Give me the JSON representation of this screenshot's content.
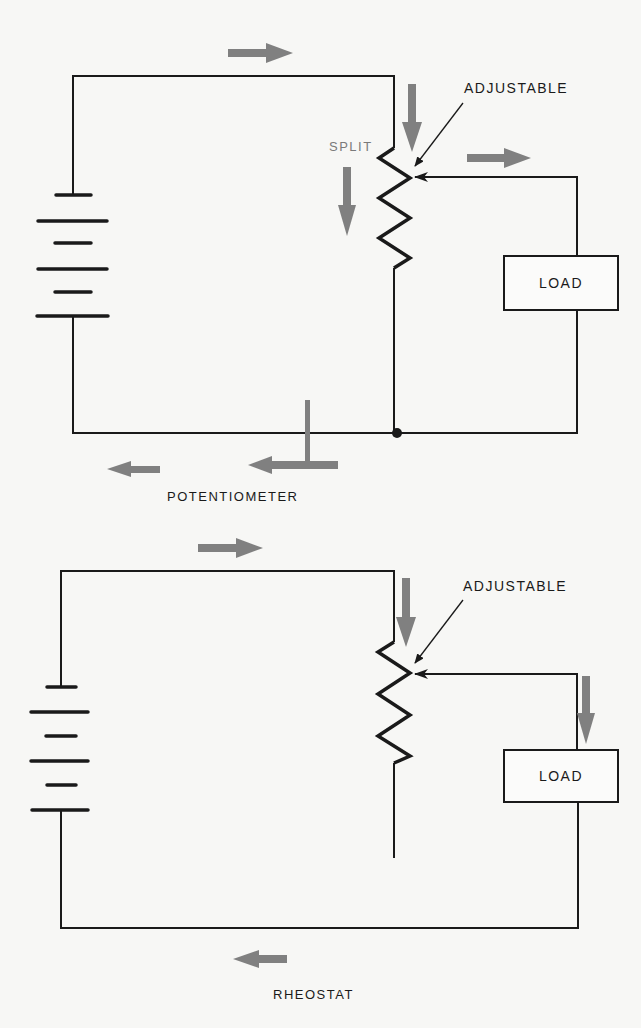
{
  "diagrams": [
    {
      "name": "potentiometer",
      "caption": "POTENTIOMETER",
      "labels": {
        "adjustable": "ADJUSTABLE",
        "split": "SPLIT",
        "load": "LOAD"
      },
      "components": [
        "battery",
        "resistor-with-wiper",
        "load",
        "junction"
      ],
      "current_arrows": [
        "top-right",
        "resistor-down",
        "split-down",
        "wiper-right",
        "bottom-left",
        "junction-merge-left"
      ]
    },
    {
      "name": "rheostat",
      "caption": "RHEOSTAT",
      "labels": {
        "adjustable": "ADJUSTABLE",
        "load": "LOAD"
      },
      "components": [
        "battery",
        "resistor-with-wiper",
        "load"
      ],
      "current_arrows": [
        "top-right",
        "resistor-down",
        "load-down",
        "bottom-left"
      ]
    }
  ],
  "colors": {
    "wire": "#1a1a1a",
    "arrow": "#808080",
    "background": "#f7f7f5",
    "split_label": "#7a7a7a"
  }
}
